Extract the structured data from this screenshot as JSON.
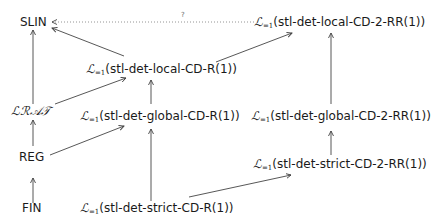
{
  "diagram": {
    "type": "hierarchy",
    "nodes": {
      "slin": {
        "label": "SLIN"
      },
      "lrat": {
        "label": "ℒℛ𝒜𝒯"
      },
      "reg": {
        "label": "REG"
      },
      "fin": {
        "label": "FIN"
      },
      "local_r": {
        "prefix": "ℒ",
        "subscript": "=1",
        "label": "(stl-det-local-CD-R(1))"
      },
      "global_r": {
        "prefix": "ℒ",
        "subscript": "=1",
        "label": "(stl-det-global-CD-R(1))"
      },
      "strict_r": {
        "prefix": "ℒ",
        "subscript": "=1",
        "label": "(stl-det-strict-CD-R(1))"
      },
      "local_rr": {
        "prefix": "ℒ",
        "subscript": "=1",
        "label": "(stl-det-local-CD-2-RR(1))"
      },
      "global_rr": {
        "prefix": "ℒ",
        "subscript": "=1",
        "label": "(stl-det-global-CD-2-RR(1))"
      },
      "strict_rr": {
        "prefix": "ℒ",
        "subscript": "=1",
        "label": "(stl-det-strict-CD-2-RR(1))"
      }
    },
    "edges": [
      {
        "from": "fin",
        "to": "reg",
        "style": "solid"
      },
      {
        "from": "reg",
        "to": "lrat",
        "style": "solid"
      },
      {
        "from": "lrat",
        "to": "slin",
        "style": "solid"
      },
      {
        "from": "local_r",
        "to": "slin",
        "style": "solid"
      },
      {
        "from": "lrat",
        "to": "local_r",
        "style": "solid"
      },
      {
        "from": "reg",
        "to": "global_r",
        "style": "solid"
      },
      {
        "from": "global_r",
        "to": "local_r",
        "style": "solid"
      },
      {
        "from": "strict_r",
        "to": "global_r",
        "style": "solid"
      },
      {
        "from": "local_r",
        "to": "local_rr",
        "style": "solid"
      },
      {
        "from": "strict_r",
        "to": "strict_rr",
        "style": "solid"
      },
      {
        "from": "strict_rr",
        "to": "global_rr",
        "style": "solid"
      },
      {
        "from": "global_rr",
        "to": "local_rr",
        "style": "solid"
      },
      {
        "from": "local_rr",
        "to": "slin",
        "style": "dotted",
        "label": "?"
      }
    ],
    "colors": {
      "line": "#444444",
      "dotted": "#888888",
      "text": "#1a1a1a"
    }
  }
}
